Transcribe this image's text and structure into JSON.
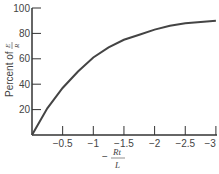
{
  "chart_data": {
    "type": "line",
    "title": "",
    "xlabel": "-Rt/L",
    "ylabel": "Percent of E/R",
    "xlim": [
      0,
      -3
    ],
    "ylim": [
      0,
      100
    ],
    "x_ticks": [
      "-0.5",
      "-1",
      "-1.5",
      "-2",
      "-2.5",
      "-3"
    ],
    "y_ticks": [
      "20",
      "40",
      "60",
      "80",
      "100"
    ],
    "grid": false,
    "legend": null,
    "series": [
      {
        "name": "Percent of E/R",
        "x": [
          0,
          -0.25,
          -0.5,
          -0.75,
          -1,
          -1.25,
          -1.5,
          -1.75,
          -2,
          -2.25,
          -2.5,
          -2.75,
          -3
        ],
        "values": [
          0,
          21,
          37,
          50,
          61,
          69,
          75,
          79,
          83,
          86,
          88,
          89,
          90
        ]
      }
    ]
  },
  "labels": {
    "y_prefix": "Percent of",
    "y_num": "E",
    "y_den": "R",
    "x_minus": "−",
    "x_num": "Rt",
    "x_den": "L"
  }
}
